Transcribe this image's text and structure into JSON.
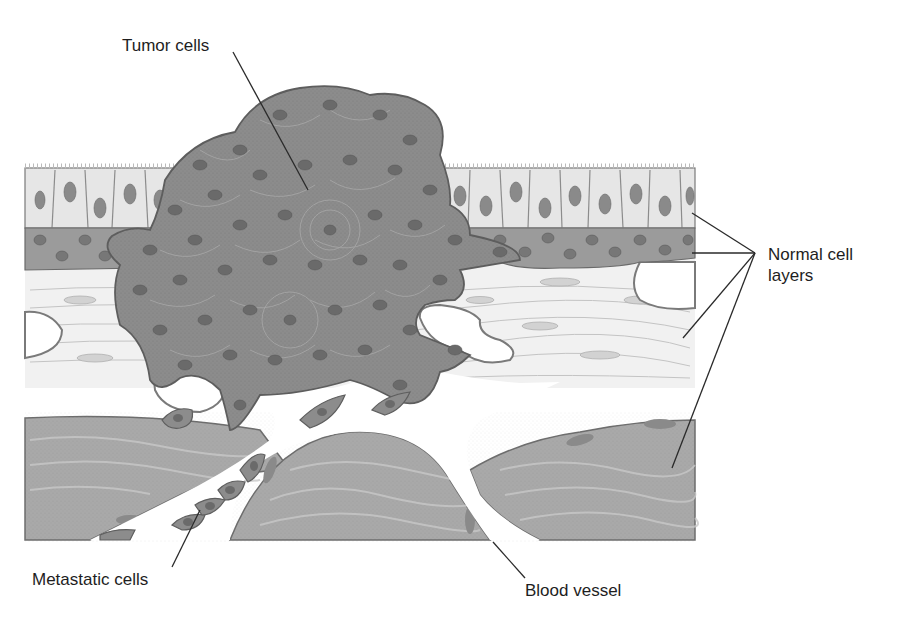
{
  "figure": {
    "labels": {
      "tumor_cells": "Tumor cells",
      "normal_cell_layers_line1": "Normal cell",
      "normal_cell_layers_line2": "layers",
      "metastatic_cells": "Metastatic cells",
      "blood_vessel": "Blood vessel"
    },
    "regions": [
      "columnar-epithelium",
      "basal-cell-layer",
      "connective-tissue",
      "smooth-muscle",
      "tumor-mass",
      "blood-vessel-lumen"
    ],
    "colors": {
      "epithelium": "#e6e6e6",
      "epithelium_nucleus": "#8a8a8a",
      "basal_layer": "#9b9b9b",
      "connective": "#f1f1f1",
      "muscle": "#a9a9a9",
      "tumor": "#8c8c8c",
      "tumor_nucleus": "#6a6a6a",
      "outline": "#5e5e5e",
      "leader_line": "#2a2a2a",
      "text": "#1e1e1e"
    }
  }
}
